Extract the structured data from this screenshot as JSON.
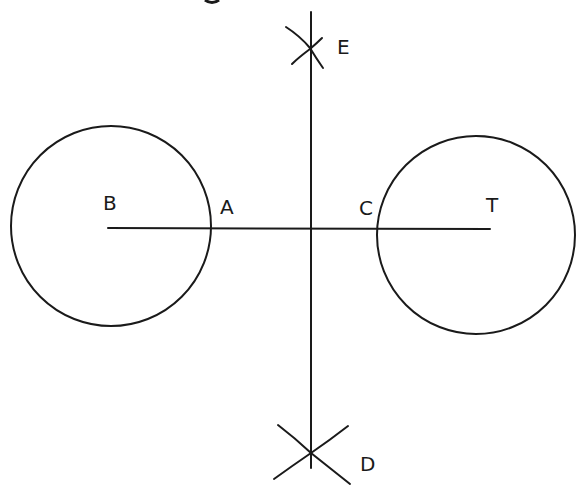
{
  "diagram": {
    "stroke_color": "#1a1a1a",
    "background_color": "#ffffff",
    "circles": [
      {
        "id": "circle-B",
        "cx": 111,
        "cy": 226,
        "r": 100
      },
      {
        "id": "circle-T",
        "cx": 476,
        "cy": 235,
        "r": 99
      }
    ],
    "segments": [
      {
        "id": "segment-BT",
        "x1": 108,
        "y1": 228,
        "x2": 490,
        "y2": 229
      },
      {
        "id": "perpendicular-bisector-ED",
        "x1": 311,
        "y1": 12,
        "x2": 311,
        "y2": 468
      }
    ],
    "labels": {
      "B": "B",
      "A": "A",
      "C": "C",
      "T": "T",
      "E": "E",
      "D": "D"
    },
    "points": [
      {
        "name": "B",
        "role": "center of left circle",
        "x": 111,
        "y": 228
      },
      {
        "name": "A",
        "role": "left circle meets segment",
        "x": 210,
        "y": 228
      },
      {
        "name": "C",
        "role": "right circle meets segment",
        "x": 381,
        "y": 229
      },
      {
        "name": "T",
        "role": "center of right circle",
        "x": 490,
        "y": 229
      },
      {
        "name": "E",
        "role": "upper arc intersection",
        "x": 310,
        "y": 48
      },
      {
        "name": "D",
        "role": "lower arc intersection",
        "x": 311,
        "y": 453
      }
    ]
  }
}
